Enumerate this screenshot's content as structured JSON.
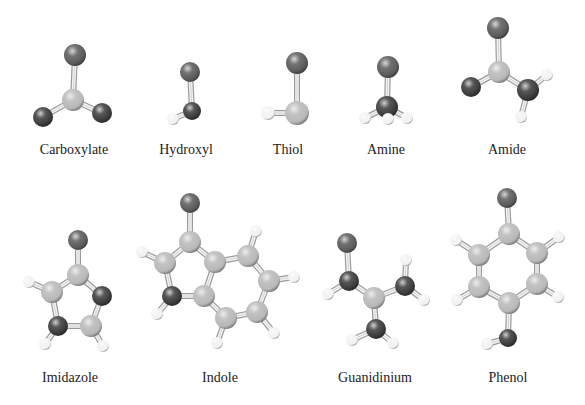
{
  "figure": {
    "atom_colors": {
      "R": "#5a5a5a",
      "O": "#3a3a3a",
      "C": "#b8b8b8",
      "H": "#f2f2f2"
    },
    "molecules": [
      {
        "name": "Carboxylate",
        "label_pos": [
          74,
          152
        ],
        "atoms": [
          {
            "id": "r",
            "type": "R",
            "x": 75,
            "y": 55,
            "r": 11
          },
          {
            "id": "c",
            "type": "C",
            "x": 73,
            "y": 100,
            "r": 11
          },
          {
            "id": "o1",
            "type": "O",
            "x": 43,
            "y": 117,
            "r": 10
          },
          {
            "id": "o2",
            "type": "O",
            "x": 102,
            "y": 113,
            "r": 10
          }
        ],
        "bonds": [
          [
            "r",
            "c"
          ],
          [
            "c",
            "o1"
          ],
          [
            "c",
            "o2"
          ]
        ]
      },
      {
        "name": "Hydroxyl",
        "label_pos": [
          186,
          152
        ],
        "atoms": [
          {
            "id": "r",
            "type": "R",
            "x": 190,
            "y": 72,
            "r": 10
          },
          {
            "id": "o",
            "type": "O",
            "x": 192,
            "y": 111,
            "r": 9
          },
          {
            "id": "h",
            "type": "H",
            "x": 173,
            "y": 119,
            "r": 6
          }
        ],
        "bonds": [
          [
            "r",
            "o"
          ],
          [
            "o",
            "h"
          ]
        ]
      },
      {
        "name": "Thiol",
        "label_pos": [
          288,
          152
        ],
        "atoms": [
          {
            "id": "r",
            "type": "R",
            "x": 297,
            "y": 63,
            "r": 11
          },
          {
            "id": "s",
            "type": "C",
            "x": 297,
            "y": 113,
            "r": 12
          },
          {
            "id": "h",
            "type": "H",
            "x": 268,
            "y": 113,
            "r": 7
          }
        ],
        "bonds": [
          [
            "r",
            "s"
          ],
          [
            "s",
            "h"
          ]
        ]
      },
      {
        "name": "Amine",
        "label_pos": [
          386,
          152
        ],
        "atoms": [
          {
            "id": "r",
            "type": "R",
            "x": 388,
            "y": 67,
            "r": 11
          },
          {
            "id": "n",
            "type": "O",
            "x": 387,
            "y": 107,
            "r": 11
          },
          {
            "id": "h1",
            "type": "H",
            "x": 365,
            "y": 118,
            "r": 6
          },
          {
            "id": "h3",
            "type": "H",
            "x": 407,
            "y": 118,
            "r": 6
          },
          {
            "id": "h2",
            "type": "H",
            "x": 388,
            "y": 119,
            "r": 6
          }
        ],
        "bonds": [
          [
            "r",
            "n"
          ],
          [
            "n",
            "h1"
          ],
          [
            "n",
            "h2"
          ],
          [
            "n",
            "h3"
          ]
        ]
      },
      {
        "name": "Amide",
        "label_pos": [
          507,
          152
        ],
        "atoms": [
          {
            "id": "r",
            "type": "R",
            "x": 498,
            "y": 28,
            "r": 11
          },
          {
            "id": "c",
            "type": "C",
            "x": 499,
            "y": 72,
            "r": 11
          },
          {
            "id": "o",
            "type": "O",
            "x": 471,
            "y": 87,
            "r": 10
          },
          {
            "id": "n",
            "type": "O",
            "x": 528,
            "y": 90,
            "r": 11
          },
          {
            "id": "h1",
            "type": "H",
            "x": 547,
            "y": 75,
            "r": 6
          },
          {
            "id": "h2",
            "type": "H",
            "x": 521,
            "y": 117,
            "r": 6
          }
        ],
        "bonds": [
          [
            "r",
            "c"
          ],
          [
            "c",
            "o"
          ],
          [
            "c",
            "n"
          ],
          [
            "n",
            "h1"
          ],
          [
            "n",
            "h2"
          ]
        ]
      },
      {
        "name": "Imidazole",
        "label_pos": [
          70,
          380
        ],
        "atoms": [
          {
            "id": "r",
            "type": "R",
            "x": 78,
            "y": 240,
            "r": 10
          },
          {
            "id": "c2",
            "type": "C",
            "x": 78,
            "y": 275,
            "r": 11
          },
          {
            "id": "cl",
            "type": "C",
            "x": 52,
            "y": 292,
            "r": 11
          },
          {
            "id": "nr",
            "type": "O",
            "x": 102,
            "y": 296,
            "r": 10
          },
          {
            "id": "nbl",
            "type": "O",
            "x": 58,
            "y": 326,
            "r": 10
          },
          {
            "id": "cbr",
            "type": "C",
            "x": 91,
            "y": 326,
            "r": 11
          },
          {
            "id": "hl",
            "type": "H",
            "x": 29,
            "y": 282,
            "r": 6
          },
          {
            "id": "hbl",
            "type": "H",
            "x": 45,
            "y": 344,
            "r": 6
          },
          {
            "id": "hbr",
            "type": "H",
            "x": 103,
            "y": 346,
            "r": 6
          }
        ],
        "bonds": [
          [
            "r",
            "c2"
          ],
          [
            "c2",
            "cl"
          ],
          [
            "c2",
            "nr"
          ],
          [
            "cl",
            "nbl"
          ],
          [
            "nr",
            "cbr"
          ],
          [
            "nbl",
            "cbr"
          ],
          [
            "cl",
            "hl"
          ],
          [
            "nbl",
            "hbl"
          ],
          [
            "cbr",
            "hbr"
          ]
        ]
      },
      {
        "name": "Indole",
        "label_pos": [
          220,
          380
        ],
        "atoms": [
          {
            "id": "r",
            "type": "R",
            "x": 190,
            "y": 203,
            "r": 10
          },
          {
            "id": "c3",
            "type": "C",
            "x": 190,
            "y": 242,
            "r": 11
          },
          {
            "id": "c2",
            "type": "C",
            "x": 165,
            "y": 263,
            "r": 11
          },
          {
            "id": "c3a",
            "type": "C",
            "x": 215,
            "y": 262,
            "r": 11
          },
          {
            "id": "n",
            "type": "O",
            "x": 172,
            "y": 296,
            "r": 10
          },
          {
            "id": "c7a",
            "type": "C",
            "x": 204,
            "y": 296,
            "r": 11
          },
          {
            "id": "c4",
            "type": "C",
            "x": 248,
            "y": 256,
            "r": 11
          },
          {
            "id": "c5",
            "type": "C",
            "x": 269,
            "y": 281,
            "r": 11
          },
          {
            "id": "c6",
            "type": "C",
            "x": 257,
            "y": 312,
            "r": 11
          },
          {
            "id": "c7",
            "type": "C",
            "x": 226,
            "y": 318,
            "r": 11
          },
          {
            "id": "h2",
            "type": "H",
            "x": 142,
            "y": 252,
            "r": 6
          },
          {
            "id": "hn",
            "type": "H",
            "x": 157,
            "y": 314,
            "r": 6
          },
          {
            "id": "h4",
            "type": "H",
            "x": 256,
            "y": 231,
            "r": 6
          },
          {
            "id": "h5",
            "type": "H",
            "x": 294,
            "y": 277,
            "r": 6
          },
          {
            "id": "h6",
            "type": "H",
            "x": 274,
            "y": 333,
            "r": 6
          },
          {
            "id": "h7",
            "type": "H",
            "x": 217,
            "y": 343,
            "r": 6
          }
        ],
        "bonds": [
          [
            "r",
            "c3"
          ],
          [
            "c3",
            "c2"
          ],
          [
            "c3",
            "c3a"
          ],
          [
            "c2",
            "n"
          ],
          [
            "n",
            "c7a"
          ],
          [
            "c3a",
            "c7a"
          ],
          [
            "c3a",
            "c4"
          ],
          [
            "c4",
            "c5"
          ],
          [
            "c5",
            "c6"
          ],
          [
            "c6",
            "c7"
          ],
          [
            "c7",
            "c7a"
          ],
          [
            "c2",
            "h2"
          ],
          [
            "n",
            "hn"
          ],
          [
            "c4",
            "h4"
          ],
          [
            "c5",
            "h5"
          ],
          [
            "c6",
            "h6"
          ],
          [
            "c7",
            "h7"
          ]
        ]
      },
      {
        "name": "Guanidinium",
        "label_pos": [
          375,
          380
        ],
        "atoms": [
          {
            "id": "r",
            "type": "R",
            "x": 347,
            "y": 243,
            "r": 10
          },
          {
            "id": "n1",
            "type": "O",
            "x": 349,
            "y": 281,
            "r": 10
          },
          {
            "id": "c",
            "type": "C",
            "x": 374,
            "y": 298,
            "r": 11
          },
          {
            "id": "n2",
            "type": "O",
            "x": 405,
            "y": 286,
            "r": 10
          },
          {
            "id": "n3",
            "type": "O",
            "x": 376,
            "y": 329,
            "r": 10
          },
          {
            "id": "h1",
            "type": "H",
            "x": 328,
            "y": 294,
            "r": 6
          },
          {
            "id": "h2a",
            "type": "H",
            "x": 406,
            "y": 260,
            "r": 6
          },
          {
            "id": "h2b",
            "type": "H",
            "x": 424,
            "y": 300,
            "r": 6
          },
          {
            "id": "h3a",
            "type": "H",
            "x": 352,
            "y": 340,
            "r": 6
          },
          {
            "id": "h3b",
            "type": "H",
            "x": 393,
            "y": 343,
            "r": 6
          }
        ],
        "bonds": [
          [
            "r",
            "n1"
          ],
          [
            "n1",
            "c"
          ],
          [
            "c",
            "n2"
          ],
          [
            "c",
            "n3"
          ],
          [
            "n1",
            "h1"
          ],
          [
            "n2",
            "h2a"
          ],
          [
            "n2",
            "h2b"
          ],
          [
            "n3",
            "h3a"
          ],
          [
            "n3",
            "h3b"
          ]
        ]
      },
      {
        "name": "Phenol",
        "label_pos": [
          508,
          380
        ],
        "atoms": [
          {
            "id": "r",
            "type": "R",
            "x": 507,
            "y": 198,
            "r": 10
          },
          {
            "id": "c1",
            "type": "C",
            "x": 509,
            "y": 234,
            "r": 11
          },
          {
            "id": "c2",
            "type": "C",
            "x": 479,
            "y": 255,
            "r": 11
          },
          {
            "id": "c6",
            "type": "C",
            "x": 537,
            "y": 253,
            "r": 11
          },
          {
            "id": "c3",
            "type": "C",
            "x": 479,
            "y": 287,
            "r": 11
          },
          {
            "id": "c5",
            "type": "C",
            "x": 537,
            "y": 284,
            "r": 11
          },
          {
            "id": "c4",
            "type": "C",
            "x": 509,
            "y": 303,
            "r": 11
          },
          {
            "id": "o",
            "type": "O",
            "x": 508,
            "y": 338,
            "r": 9
          },
          {
            "id": "h2",
            "type": "H",
            "x": 456,
            "y": 240,
            "r": 6
          },
          {
            "id": "h6",
            "type": "H",
            "x": 559,
            "y": 237,
            "r": 6
          },
          {
            "id": "h3",
            "type": "H",
            "x": 457,
            "y": 300,
            "r": 6
          },
          {
            "id": "h5",
            "type": "H",
            "x": 558,
            "y": 297,
            "r": 6
          },
          {
            "id": "ho",
            "type": "H",
            "x": 487,
            "y": 344,
            "r": 6
          }
        ],
        "bonds": [
          [
            "r",
            "c1"
          ],
          [
            "c1",
            "c2"
          ],
          [
            "c1",
            "c6"
          ],
          [
            "c2",
            "c3"
          ],
          [
            "c6",
            "c5"
          ],
          [
            "c3",
            "c4"
          ],
          [
            "c5",
            "c4"
          ],
          [
            "c4",
            "o"
          ],
          [
            "c2",
            "h2"
          ],
          [
            "c6",
            "h6"
          ],
          [
            "c3",
            "h3"
          ],
          [
            "c5",
            "h5"
          ],
          [
            "o",
            "ho"
          ]
        ]
      }
    ]
  }
}
